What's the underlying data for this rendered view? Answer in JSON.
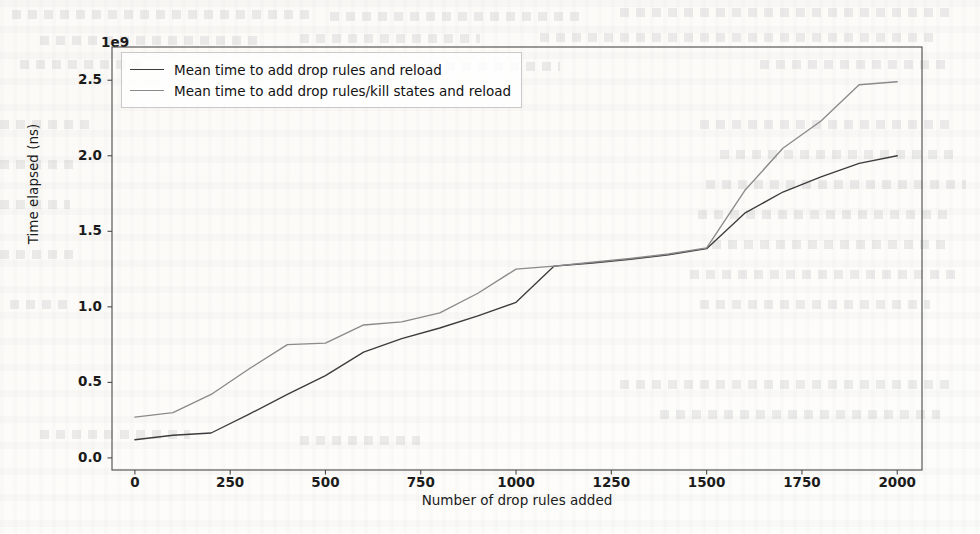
{
  "chart_data": {
    "type": "line",
    "title": "",
    "xlabel": "Number of drop rules added",
    "ylabel": "Time elapsed (ns)",
    "y_offset_label": "1e9",
    "xlim": [
      -60,
      2065
    ],
    "ylim": [
      -80000000.0,
      2720000000.0
    ],
    "xticks": [
      0,
      250,
      500,
      750,
      1000,
      1250,
      1500,
      1750,
      2000
    ],
    "xtick_labels": [
      "0",
      "250",
      "500",
      "750",
      "1000",
      "1250",
      "1500",
      "1750",
      "2000"
    ],
    "yticks": [
      0,
      500000000,
      1000000000,
      1500000000,
      2000000000,
      2500000000
    ],
    "ytick_labels": [
      "0.0",
      "0.5",
      "1.0",
      "1.5",
      "2.0",
      "2.5"
    ],
    "grid": false,
    "legend_position": "upper left",
    "series": [
      {
        "name": "Mean time to add drop rules and reload",
        "color": "#3c3c3c",
        "x": [
          0,
          100,
          200,
          300,
          400,
          500,
          600,
          700,
          800,
          900,
          1000,
          1100,
          1200,
          1300,
          1400,
          1500,
          1600,
          1700,
          1800,
          1900,
          2000
        ],
        "values": [
          120000000,
          150000000,
          165000000,
          290000000,
          420000000,
          545000000,
          700000000,
          790000000,
          860000000,
          940000000,
          1030000000,
          1270000000,
          1290000000,
          1315000000,
          1345000000,
          1385000000,
          1620000000,
          1760000000,
          1860000000,
          1950000000,
          2000000000
        ]
      },
      {
        "name": "Mean time to add drop rules/kill states and reload",
        "color": "#8a8a8a",
        "x": [
          0,
          100,
          200,
          300,
          400,
          500,
          600,
          700,
          800,
          900,
          1000,
          1100,
          1200,
          1300,
          1400,
          1500,
          1600,
          1700,
          1800,
          1900,
          2000
        ],
        "values": [
          270000000,
          300000000,
          420000000,
          590000000,
          750000000,
          760000000,
          880000000,
          900000000,
          960000000,
          1090000000,
          1250000000,
          1270000000,
          1295000000,
          1320000000,
          1350000000,
          1390000000,
          1770000000,
          2050000000,
          2230000000,
          2470000000,
          2490000000
        ]
      }
    ]
  },
  "legend": {
    "entries": [
      {
        "label": "Mean time to add drop rules and reload",
        "color": "#3c3c3c"
      },
      {
        "label": "Mean time to add drop rules/kill states and reload",
        "color": "#8a8a8a"
      }
    ]
  }
}
